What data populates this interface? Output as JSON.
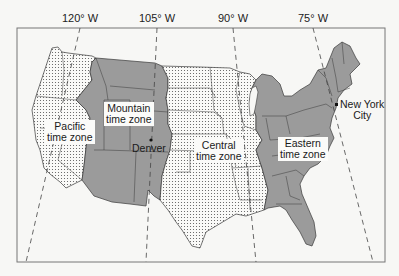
{
  "map": {
    "title": "U.S. time zones map",
    "meridians": [
      {
        "label": "120° W",
        "x": 80
      },
      {
        "label": "105° W",
        "x": 157
      },
      {
        "label": "90° W",
        "x": 233
      },
      {
        "label": "75° W",
        "x": 313
      }
    ],
    "zones": [
      {
        "name": "Pacific",
        "label_line1": "Pacific",
        "label_line2": "time zone",
        "fill": "dotted"
      },
      {
        "name": "Mountain",
        "label_line1": "Mountain",
        "label_line2": "time zone",
        "fill": "gray"
      },
      {
        "name": "Central",
        "label_line1": "Central",
        "label_line2": "time zone",
        "fill": "dotted"
      },
      {
        "name": "Eastern",
        "label_line1": "Eastern",
        "label_line2": "time zone",
        "fill": "gray"
      }
    ],
    "cities": [
      {
        "name": "Denver",
        "label": "Denver"
      },
      {
        "name": "New York City",
        "label_line1": "New York",
        "label_line2": "City"
      }
    ],
    "colors": {
      "gray_zone": "#9b9b9b",
      "dotted_bg": "#fafaf8",
      "dot": "#555555",
      "border": "#3a3a3a",
      "frame": "#777777",
      "background": "#f7f7f5"
    }
  }
}
